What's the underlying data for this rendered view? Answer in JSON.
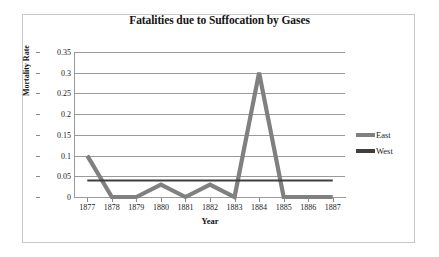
{
  "figure": {
    "title": "Fatalities due to Suffocation by Gases"
  },
  "axes": {
    "x_title": "Year",
    "y_title": "Mortality Rate",
    "y_ticks": [
      "0",
      "0.05",
      "0.1",
      "0.15",
      "0.2",
      "0.25",
      "0.3",
      "0.35"
    ],
    "x_ticks": [
      "1877",
      "1878",
      "1879",
      "1880",
      "1881",
      "1882",
      "1883",
      "1884",
      "1885",
      "1886",
      "1887"
    ]
  },
  "legend": {
    "entries": [
      {
        "label": "East",
        "color": "#808080"
      },
      {
        "label": "West",
        "color": "#3f3f3f"
      }
    ]
  },
  "chart_data": {
    "type": "line",
    "title": "Fatalities due to Suffocation by Gases",
    "xlabel": "Year",
    "ylabel": "Mortality Rate",
    "categories": [
      "1877",
      "1878",
      "1879",
      "1880",
      "1881",
      "1882",
      "1883",
      "1884",
      "1885",
      "1886",
      "1887"
    ],
    "x": [
      1877,
      1878,
      1879,
      1880,
      1881,
      1882,
      1883,
      1884,
      1885,
      1886,
      1887
    ],
    "series": [
      {
        "name": "East",
        "color": "#808080",
        "values": [
          0.1,
          0,
          0,
          0.03,
          0,
          0.03,
          0,
          0.3,
          0,
          0,
          0
        ]
      },
      {
        "name": "West",
        "color": "#3f3f3f",
        "values": [
          0.04,
          0.04,
          0.04,
          0.04,
          0.04,
          0.04,
          0.04,
          0.04,
          0.04,
          0.04,
          0.04
        ]
      }
    ],
    "ylim": [
      0,
      0.35
    ],
    "ytick_step": 0.05,
    "grid": true,
    "grid_axis": "y",
    "legend_position": "right"
  }
}
